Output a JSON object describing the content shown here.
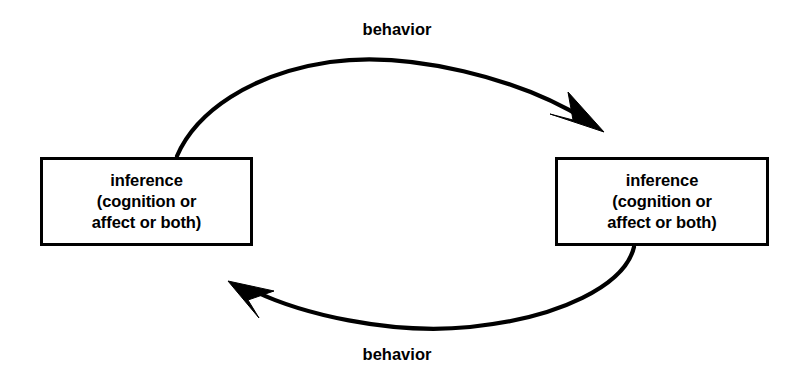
{
  "diagram": {
    "type": "cyclic-feedback-loop",
    "background_color": "#ffffff",
    "stroke_color": "#000000",
    "nodes": [
      {
        "id": "inference-left",
        "position": "left",
        "lines": [
          "inference",
          "(cognition or",
          "affect or both)"
        ]
      },
      {
        "id": "inference-right",
        "position": "right",
        "lines": [
          "inference",
          "(cognition or",
          "affect or both)"
        ]
      }
    ],
    "edges": [
      {
        "id": "behavior-top",
        "label": "behavior",
        "from": "inference-left",
        "to": "inference-right",
        "direction": "left-to-right",
        "shape": "arc-over-top",
        "arrowhead": "filled-barb"
      },
      {
        "id": "behavior-bottom",
        "label": "behavior",
        "from": "inference-right",
        "to": "inference-left",
        "direction": "right-to-left",
        "shape": "arc-under-bottom",
        "arrowhead": "filled-barb"
      }
    ]
  }
}
